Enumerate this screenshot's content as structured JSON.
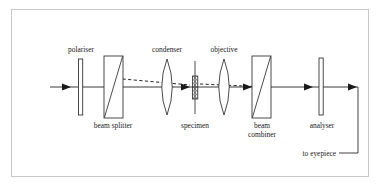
{
  "figure": {
    "frame_color": "#c9c9c9",
    "line_color": "#1a1a1a",
    "background": "#ffffff"
  },
  "labels": {
    "polariser": "polariser",
    "condenser": "condenser",
    "objective": "objective",
    "beam_splitter": "beam splitter",
    "specimen": "specimen",
    "beam_combiner_line1": "beam",
    "beam_combiner_line2": "combiner",
    "analyser": "analyser",
    "to_eyepiece": "to eyepiece"
  },
  "components": [
    {
      "name": "polariser",
      "type": "plate",
      "x": 80,
      "label_position": "above"
    },
    {
      "name": "beam-splitter",
      "type": "beam-splitter-block",
      "x": 113,
      "label_position": "below"
    },
    {
      "name": "condenser",
      "type": "biconvex-lens",
      "x": 167,
      "label_position": "above"
    },
    {
      "name": "specimen",
      "type": "hatched-slide",
      "x": 195,
      "label_position": "below"
    },
    {
      "name": "objective",
      "type": "biconvex-lens",
      "x": 224,
      "label_position": "above"
    },
    {
      "name": "beam-combiner",
      "type": "beam-combiner-block",
      "x": 262,
      "label_position": "below"
    },
    {
      "name": "analyser",
      "type": "plate",
      "x": 321,
      "label_position": "below"
    }
  ],
  "rays": {
    "axis_y": 87,
    "solid_ray_start_x": 50,
    "solid_ray_end_x": 358,
    "eyepiece_path": "down then left to eyepiece label",
    "dashed_ray_description": "split beam dipping to specimen and recombining at beam combiner"
  }
}
